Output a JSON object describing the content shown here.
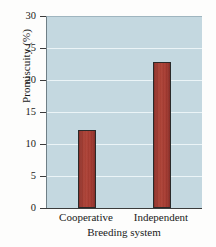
{
  "chart_data": {
    "type": "bar",
    "title": "",
    "xlabel": "Breeding system",
    "ylabel": "Promiscuity (%)",
    "categories": [
      "Cooperative",
      "Independent"
    ],
    "values": [
      12.3,
      23.0
    ],
    "ylim": [
      0,
      30
    ],
    "yticks": [
      0,
      5,
      10,
      15,
      20,
      25,
      30
    ],
    "ytick_labels": [
      "0",
      "5",
      "10",
      "15",
      "20",
      "25",
      "30"
    ],
    "grid": true,
    "legend": "none",
    "colors": {
      "bar_fill": "#a83c32",
      "bar_edge": "#2a2a2a",
      "plot_background": "#c4d8e0",
      "gridline": "#eef6f8",
      "axis": "#3b3b3b",
      "figure_background": "#fdfdfc",
      "text": "#1a1a1a"
    }
  }
}
